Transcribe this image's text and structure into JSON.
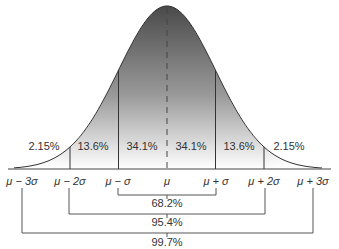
{
  "chart_data": {
    "type": "area",
    "title": "",
    "xlabel": "",
    "ylabel": "",
    "grid": false,
    "legend": "none",
    "distribution": "normal",
    "x_tick_labels": [
      "μ − 3σ",
      "μ − 2σ",
      "μ − σ",
      "μ",
      "μ + σ",
      "μ + 2σ",
      "μ + 3σ"
    ],
    "x_tick_values": [
      -3,
      -2,
      -1,
      0,
      1,
      2,
      3
    ],
    "regions": [
      {
        "from": -3,
        "to": -2,
        "percent": "2.15%",
        "value": 2.15
      },
      {
        "from": -2,
        "to": -1,
        "percent": "13.6%",
        "value": 13.6
      },
      {
        "from": -1,
        "to": 0,
        "percent": "34.1%",
        "value": 34.1
      },
      {
        "from": 0,
        "to": 1,
        "percent": "34.1%",
        "value": 34.1
      },
      {
        "from": 1,
        "to": 2,
        "percent": "13.6%",
        "value": 13.6
      },
      {
        "from": 2,
        "to": 3,
        "percent": "2.15%",
        "value": 2.15
      }
    ],
    "brackets": [
      {
        "from": -1,
        "to": 1,
        "label": "68.2%",
        "value": 68.2
      },
      {
        "from": -2,
        "to": 2,
        "label": "95.4%",
        "value": 95.4
      },
      {
        "from": -3,
        "to": 3,
        "label": "99.7%",
        "value": 99.7
      }
    ],
    "annotations": [
      "dashed vertical line at μ"
    ],
    "colors": {
      "fill_dark": "#555555",
      "fill_light": "#ffffff",
      "line": "#333333"
    }
  },
  "labels": {
    "regions": [
      "2.15%",
      "13.6%",
      "34.1%",
      "34.1%",
      "13.6%",
      "2.15%"
    ],
    "ticks": [
      "μ − 3σ",
      "μ − 2σ",
      "μ − σ",
      "μ",
      "μ + σ",
      "μ + 2σ",
      "μ + 3σ"
    ],
    "brackets": [
      "68.2%",
      "95.4%",
      "99.7%"
    ]
  }
}
